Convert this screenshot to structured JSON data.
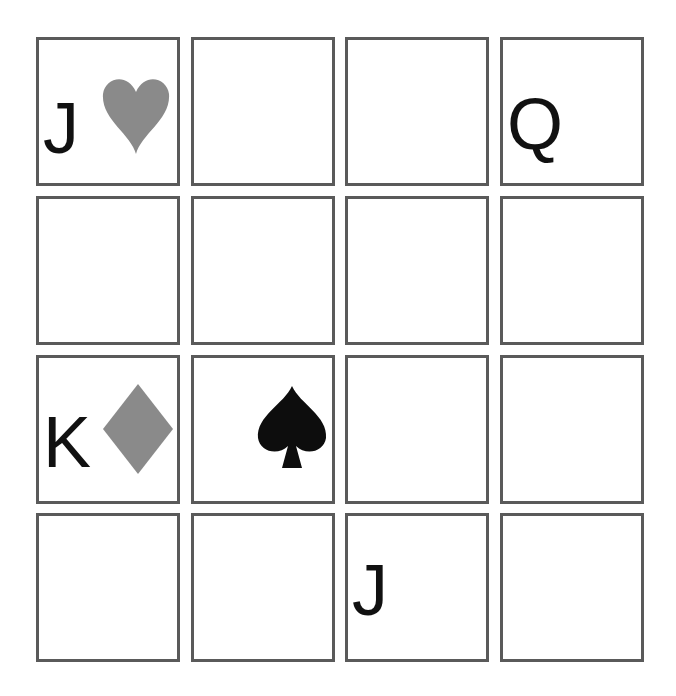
{
  "board": {
    "rows": 4,
    "cols": 4,
    "cells": [
      {
        "row": 0,
        "col": 0,
        "rank": "J",
        "suit": "heart"
      },
      {
        "row": 0,
        "col": 1,
        "rank": "",
        "suit": ""
      },
      {
        "row": 0,
        "col": 2,
        "rank": "",
        "suit": ""
      },
      {
        "row": 0,
        "col": 3,
        "rank": "Q",
        "suit": ""
      },
      {
        "row": 1,
        "col": 0,
        "rank": "",
        "suit": ""
      },
      {
        "row": 1,
        "col": 1,
        "rank": "",
        "suit": ""
      },
      {
        "row": 1,
        "col": 2,
        "rank": "",
        "suit": ""
      },
      {
        "row": 1,
        "col": 3,
        "rank": "",
        "suit": ""
      },
      {
        "row": 2,
        "col": 0,
        "rank": "K",
        "suit": "diamond"
      },
      {
        "row": 2,
        "col": 1,
        "rank": "",
        "suit": "spade"
      },
      {
        "row": 2,
        "col": 2,
        "rank": "",
        "suit": ""
      },
      {
        "row": 2,
        "col": 3,
        "rank": "",
        "suit": ""
      },
      {
        "row": 3,
        "col": 0,
        "rank": "",
        "suit": ""
      },
      {
        "row": 3,
        "col": 1,
        "rank": "",
        "suit": ""
      },
      {
        "row": 3,
        "col": 2,
        "rank": "J",
        "suit": ""
      },
      {
        "row": 3,
        "col": 3,
        "rank": "",
        "suit": ""
      }
    ]
  },
  "colors": {
    "border": "#5a5a5a",
    "rank_text": "#111111",
    "heart": "#8a8a8a",
    "diamond": "#8a8a8a",
    "spade": "#0d0d0d"
  }
}
